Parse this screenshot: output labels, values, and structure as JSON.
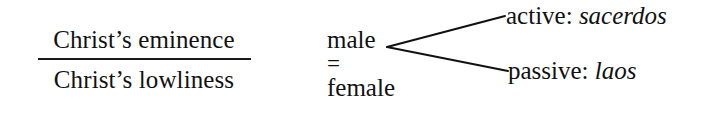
{
  "figure": {
    "type": "theological-schema-diagram",
    "background_color": "#ffffff",
    "ink_color": "#111111"
  },
  "fraction": {
    "numerator": "Christ’s eminence",
    "denominator": "Christ’s lowliness",
    "bar_color": "#1a1a1a"
  },
  "pair": {
    "top": "male",
    "relation": "=",
    "bottom": "female"
  },
  "branches": {
    "vertex": {
      "x": 387,
      "y": 47
    },
    "upper_end": {
      "x": 505,
      "y": 16
    },
    "lower_end": {
      "x": 508,
      "y": 71
    },
    "stroke_color": "#111111",
    "stroke_width": 2
  },
  "outcomes": [
    {
      "label": "active:",
      "term": "sacerdos"
    },
    {
      "label": "passive:",
      "term": "laos"
    }
  ]
}
